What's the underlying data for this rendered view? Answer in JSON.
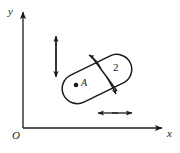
{
  "figure": {
    "title": "",
    "background_color": "#ffffff",
    "stroke_color": "#1a1a1a",
    "width": 180,
    "height": 153
  },
  "axes": {
    "y_label": "y",
    "x_label": "x",
    "origin_label": "O",
    "y_axis": {
      "x": 23,
      "top": 10,
      "bottom": 128
    },
    "x_axis": {
      "y": 128,
      "left": 23,
      "right": 164
    },
    "arrow_style": "solid-filled-triangle"
  },
  "shapes": {
    "control_volume": {
      "name": "closed-loop-boundary",
      "description": "elongated rounded closed curve (stadium) tilted counter-clockwise-down to the right",
      "center": {
        "x": 97,
        "y": 79
      },
      "rotation_deg": -26,
      "length": 74,
      "width": 30
    },
    "divider": {
      "name": "interior-dividing-line",
      "from": {
        "x": 93,
        "y": 59
      },
      "to": {
        "x": 116,
        "y": 90
      }
    },
    "point_marker": {
      "name": "point-A",
      "x": 76,
      "y": 85,
      "radius": 2.2
    }
  },
  "labels": {
    "point_label": "A",
    "region_label": "2"
  },
  "annotations": [
    {
      "name": "vertical-double-arrow",
      "orientation": "vertical",
      "x": 56,
      "y1": 34,
      "y2": 78
    },
    {
      "name": "horizontal-double-arrow",
      "orientation": "horizontal",
      "y": 113,
      "x1": 97,
      "x2": 133
    },
    {
      "name": "divider-arrow-upper-left",
      "orientation": "diagonal",
      "from": {
        "x": 100,
        "y": 68
      },
      "to": {
        "x": 88,
        "y": 54
      }
    },
    {
      "name": "divider-arrow-lower-right",
      "orientation": "diagonal",
      "from": {
        "x": 108,
        "y": 79
      },
      "to": {
        "x": 117,
        "y": 95
      }
    }
  ]
}
